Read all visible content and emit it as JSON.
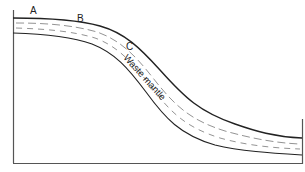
{
  "diagram": {
    "type": "cross-section",
    "labels": {
      "point_a": "A",
      "point_b": "B",
      "point_c": "C",
      "layer": "Waste mantle"
    },
    "colors": {
      "line": "#222222",
      "frame": "#555555",
      "dash": "#777777",
      "background": "#ffffff"
    }
  }
}
